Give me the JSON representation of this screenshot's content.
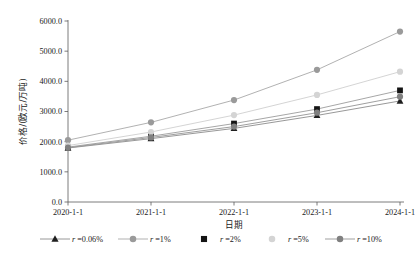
{
  "chart_data": {
    "type": "line",
    "title": "",
    "xlabel": "日期",
    "ylabel": "价格/(欧元/万吨)",
    "categories": [
      "2020-1-1",
      "2021-1-1",
      "2022-1-1",
      "2023-1-1",
      "2024-1-1"
    ],
    "ylim": [
      0,
      6000
    ],
    "ytick_labels": [
      "0.0",
      "1000.0",
      "2000.0",
      "3000.0",
      "4000.0",
      "5000.0",
      "6000.0"
    ],
    "ytick_values": [
      0,
      1000,
      2000,
      3000,
      4000,
      5000,
      6000
    ],
    "grid": false,
    "legend_position": "bottom",
    "series": [
      {
        "name": "r =0.06%",
        "rate_label": "0.06%",
        "marker": "triangle",
        "color": "#1f1f1f",
        "line_color": "#8c8c8c",
        "values": [
          1790,
          2100,
          2440,
          2870,
          3350
        ]
      },
      {
        "name": "r =1%",
        "rate_label": "1%",
        "marker": "circle",
        "color": "#9a9a9a",
        "line_color": "#a8a8a8",
        "values": [
          2050,
          2640,
          3380,
          4380,
          5650
        ]
      },
      {
        "name": "r =2%",
        "rate_label": "2%",
        "marker": "square",
        "color": "#141414",
        "line_color": "#9c9c9c",
        "values": [
          1820,
          2180,
          2600,
          3080,
          3700
        ]
      },
      {
        "name": "r =5%",
        "rate_label": "5%",
        "marker": "circle",
        "color": "#d4d4d4",
        "line_color": "#cfcfcf",
        "values": [
          1870,
          2320,
          2880,
          3550,
          4320
        ]
      },
      {
        "name": "r =10%",
        "rate_label": "10%",
        "marker": "circle",
        "color": "#808080",
        "line_color": "#949494",
        "values": [
          1800,
          2140,
          2500,
          2960,
          3490
        ]
      }
    ]
  },
  "legend": {
    "prefix": "r",
    "equals": "=",
    "items": [
      {
        "label": "r =0.06%",
        "rate": "0.06%"
      },
      {
        "label": "r =1%",
        "rate": "1%"
      },
      {
        "label": "r =2%",
        "rate": "2%"
      },
      {
        "label": "r =5%",
        "rate": "5%"
      },
      {
        "label": "r =10%",
        "rate": "10%"
      }
    ]
  }
}
